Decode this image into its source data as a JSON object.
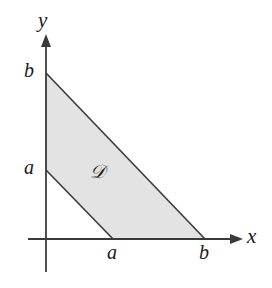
{
  "figure": {
    "type": "cartesian-region-diagram",
    "background_color": "#ffffff",
    "stroke_color": "#3a3a3a",
    "fill_color": "#e3e3e3",
    "label_color": "#1a1a1a"
  },
  "axes": {
    "x": {
      "label": "x",
      "origin_px": 46,
      "line_y_px": 239,
      "start_px": 28,
      "arrow_tip_px": 243,
      "ticks": [
        {
          "label": "a",
          "position_px": 113
        },
        {
          "label": "b",
          "position_px": 205
        }
      ]
    },
    "y": {
      "label": "y",
      "origin_px": 239,
      "line_x_px": 46,
      "start_px": 272,
      "arrow_tip_px": 34,
      "ticks": [
        {
          "label": "a",
          "position_px": 170
        },
        {
          "label": "b",
          "position_px": 73
        }
      ]
    }
  },
  "region": {
    "label": "𝒟",
    "label_plain": "D",
    "fill": "#e3e3e3",
    "vertices_px": [
      {
        "x": 46,
        "y": 73
      },
      {
        "x": 205,
        "y": 239
      },
      {
        "x": 113,
        "y": 239
      },
      {
        "x": 46,
        "y": 170
      }
    ]
  },
  "chart_data": {
    "type": "area",
    "title": "",
    "xlabel": "x",
    "ylabel": "y",
    "grid": false,
    "legend": null,
    "xtick_labels": [
      "a",
      "b"
    ],
    "ytick_labels": [
      "a",
      "b"
    ],
    "boundaries": [
      {
        "name": "upper-line",
        "from": [
          0,
          "b"
        ],
        "to": [
          "b",
          0
        ]
      },
      {
        "name": "lower-line",
        "from": [
          0,
          "a"
        ],
        "to": [
          "a",
          0
        ]
      }
    ],
    "annotations": [
      {
        "text": "𝒟",
        "x_px": 99,
        "y_px": 174
      }
    ]
  }
}
